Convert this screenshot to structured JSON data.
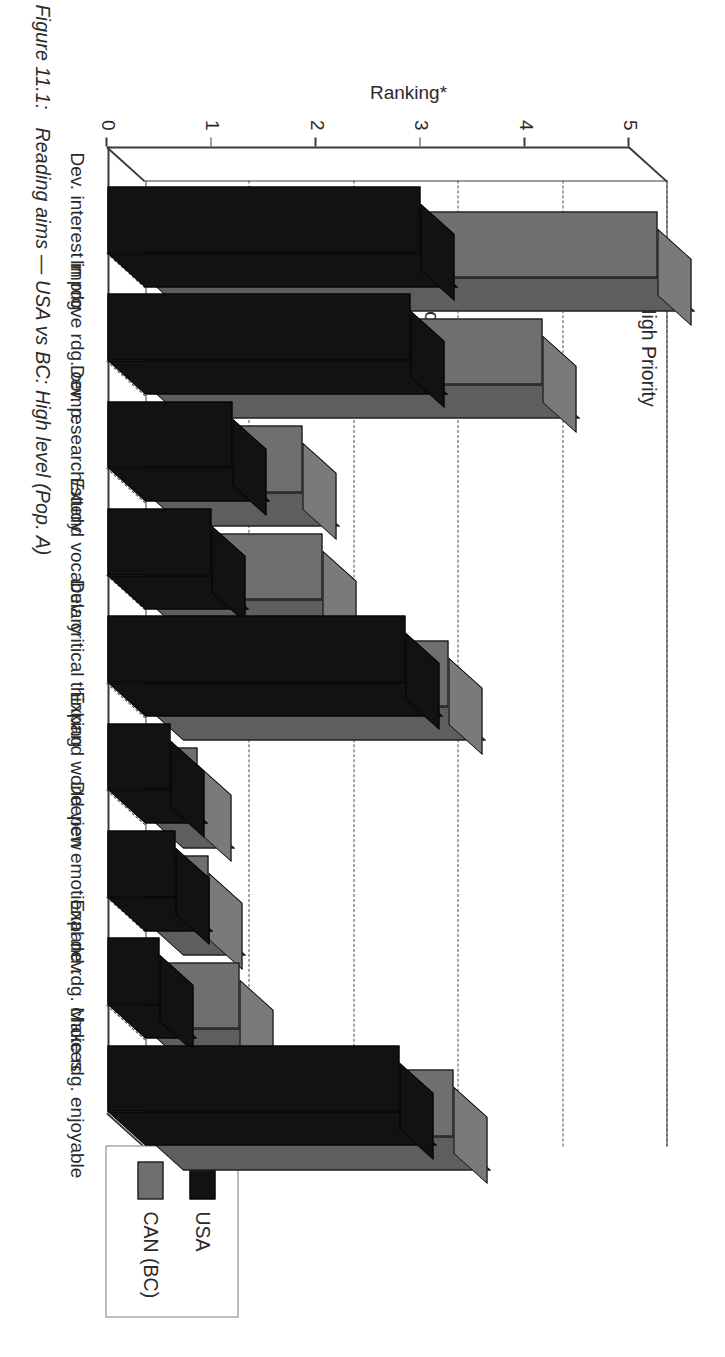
{
  "figure": {
    "number": "Figure 11.1:",
    "caption": "Reading aims — USA vs BC: High level (Pop. A)"
  },
  "annotations": {
    "high_priority": "High Priority",
    "low_priority": "Low Priority"
  },
  "legend": {
    "items": [
      {
        "label": "USA",
        "color": "#121212"
      },
      {
        "label": "CAN (BC)",
        "color": "#6f6f6f"
      }
    ]
  },
  "axis": {
    "y_title": "Ranking*",
    "y_ticks": [
      "5",
      "4",
      "3",
      "2",
      "1",
      "0"
    ]
  },
  "chart_data": {
    "type": "bar",
    "title": "Reading aims — USA vs BC: High level (Pop. A)",
    "xlabel": "",
    "ylabel": "Ranking*",
    "ylim": [
      0,
      5
    ],
    "grid": true,
    "legend_position": "right",
    "style": "3d-clustered-bar",
    "categories": [
      "Dev. interest in rdg.",
      "Improve rdg. comp.",
      "Dev. research/study",
      "Extend vocabulary",
      "Dev. critical thinking",
      "Expand world view",
      "Deepen emotional dev.",
      "Expand rdg. choices",
      "Make rdg. enjoyable"
    ],
    "series": [
      {
        "name": "USA",
        "color": "#121212",
        "values": [
          3.0,
          2.9,
          1.2,
          1.0,
          2.85,
          0.6,
          0.65,
          0.5,
          2.8
        ]
      },
      {
        "name": "CAN (BC)",
        "color": "#6f6f6f",
        "values": [
          4.9,
          3.8,
          1.5,
          1.7,
          2.9,
          0.5,
          0.6,
          0.9,
          2.95
        ]
      }
    ],
    "annotations": [
      {
        "text": "High Priority",
        "at_value": 5.0
      },
      {
        "text": "Low Priority",
        "at_value": 2.9
      }
    ]
  }
}
